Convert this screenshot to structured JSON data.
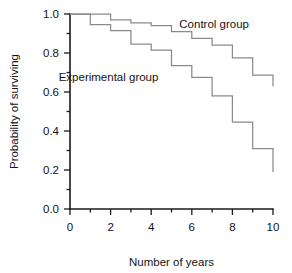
{
  "chart_data": {
    "type": "line",
    "title": "",
    "subtitle": "",
    "xlabel": "Number of years",
    "ylabel": "Probability of surviving",
    "xlim": [
      0,
      10
    ],
    "ylim": [
      0.0,
      1.0
    ],
    "grid": false,
    "legend_position": "inline-annotation",
    "step_style": "post",
    "xticks": [
      0,
      2,
      4,
      6,
      8,
      10
    ],
    "xticklabels": [
      "0",
      "2",
      "4",
      "6",
      "8",
      "10"
    ],
    "xminorticks": [
      1,
      3,
      5,
      7,
      9
    ],
    "yticks": [
      0.0,
      0.2,
      0.4,
      0.6,
      0.8,
      1.0
    ],
    "yticklabels": [
      "0.0",
      "0.2",
      "0.4",
      "0.6",
      "0.8",
      "1.0"
    ],
    "yminorticks": [
      0.1,
      0.3,
      0.5,
      0.7,
      0.9
    ],
    "x": [
      0,
      1,
      2,
      3,
      4,
      5,
      6,
      7,
      8,
      9,
      10
    ],
    "series": [
      {
        "name": "Control group",
        "color": "#8a8a8a",
        "values": [
          1.0,
          1.0,
          0.97,
          0.955,
          0.94,
          0.91,
          0.875,
          0.84,
          0.775,
          0.687,
          0.63
        ],
        "annotation": {
          "text": "Control group",
          "x": 7.1,
          "y": 0.93
        }
      },
      {
        "name": "Experimental group",
        "color": "#8a8a8a",
        "values": [
          1.0,
          0.945,
          0.915,
          0.845,
          0.815,
          0.735,
          0.675,
          0.58,
          0.445,
          0.31,
          0.19
        ],
        "annotation": {
          "text": "Experimental group",
          "x": 1.9,
          "y": 0.655
        }
      }
    ]
  }
}
